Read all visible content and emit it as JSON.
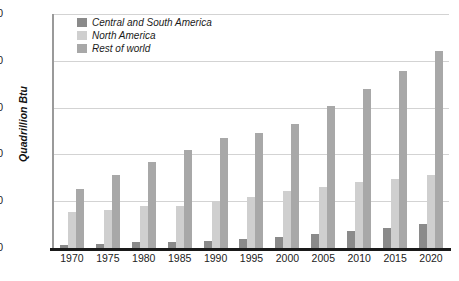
{
  "chart_data": {
    "type": "bar",
    "title": "",
    "xlabel": "",
    "ylabel": "Quadrillion Btu",
    "ylim": [
      0,
      500
    ],
    "yticks": [
      0,
      100,
      200,
      300,
      400,
      500
    ],
    "grid": true,
    "legend_position": "top-left",
    "categories": [
      "1970",
      "1975",
      "1980",
      "1985",
      "1990",
      "1995",
      "2000",
      "2005",
      "2010",
      "2015",
      "2020"
    ],
    "series": [
      {
        "name": "Central and South America",
        "color": "#8a8a8a",
        "values": [
          7,
          9,
          12,
          13,
          16,
          20,
          24,
          30,
          36,
          43,
          51
        ]
      },
      {
        "name": "North America",
        "color": "#cfcfcf",
        "values": [
          77,
          81,
          90,
          89,
          100,
          108,
          122,
          130,
          140,
          147,
          155
        ]
      },
      {
        "name": "Rest of world",
        "color": "#a8a8a8",
        "values": [
          126,
          155,
          184,
          209,
          235,
          245,
          265,
          303,
          340,
          378,
          420
        ]
      }
    ]
  },
  "axis": {
    "y_title": "Quadrillion Btu"
  },
  "caption": {
    "text": ""
  }
}
